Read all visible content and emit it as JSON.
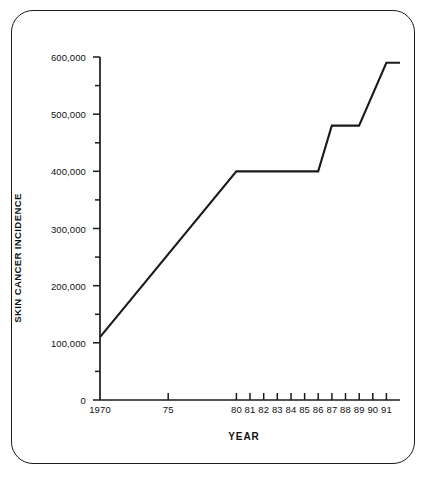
{
  "chart_data": {
    "type": "line",
    "title": "",
    "xlabel": "YEAR",
    "ylabel": "SKIN CANCER INCIDENCE",
    "grid": false,
    "legend": false,
    "legend_position": "none",
    "line_color": "#1a1a1a",
    "frame_color": "#1a1a1a",
    "background_color": "#ffffff",
    "xlim": [
      1970,
      1992
    ],
    "ylim": [
      0,
      600000
    ],
    "x_major_ticks": [
      1970,
      1975,
      1980,
      1981,
      1982,
      1983,
      1984,
      1985,
      1986,
      1987,
      1988,
      1989,
      1990,
      1991
    ],
    "x_tick_labels": [
      "1970",
      "75",
      "80",
      "81",
      "82",
      "83",
      "84",
      "85",
      "86",
      "87",
      "88",
      "89",
      "90",
      "91"
    ],
    "y_major_ticks": [
      0,
      100000,
      200000,
      300000,
      400000,
      500000,
      600000
    ],
    "y_tick_labels": [
      "0",
      "100,000",
      "200,000",
      "300,000",
      "400,000",
      "500,000",
      "600,000"
    ],
    "y_minor_ticks": [
      50000,
      150000,
      250000,
      350000,
      450000,
      550000
    ],
    "x": [
      1970,
      1980,
      1986,
      1987,
      1989,
      1991,
      1992
    ],
    "values": [
      110000,
      400000,
      400000,
      480000,
      480000,
      590000,
      590000
    ],
    "series": [
      {
        "name": "Skin cancer incidence",
        "x": [
          1970,
          1980,
          1986,
          1987,
          1989,
          1991,
          1992
        ],
        "values": [
          110000,
          400000,
          400000,
          480000,
          480000,
          590000,
          590000
        ]
      }
    ],
    "annotations": []
  }
}
